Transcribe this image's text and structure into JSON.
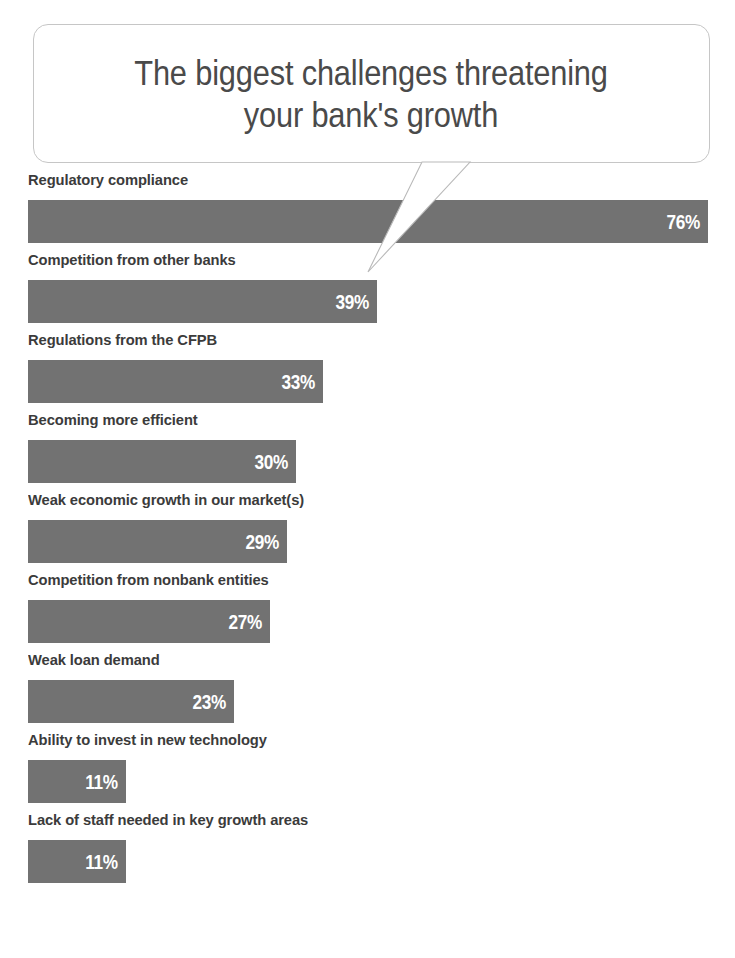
{
  "title": {
    "line1": "The biggest challenges threatening",
    "line2": "your bank's growth",
    "full": "The biggest challenges threatening\nyour bank's growth"
  },
  "colors": {
    "bar": "#727272",
    "bar_value_text": "#ffffff",
    "label_text": "#3b3b3b",
    "title_text": "#4a4a4a",
    "bubble_border": "#c6c6c6",
    "background": "#ffffff"
  },
  "chart_data": {
    "type": "bar",
    "orientation": "horizontal",
    "title": "The biggest challenges threatening your bank's growth",
    "subtitle": "",
    "xlabel": "",
    "ylabel": "",
    "grid": false,
    "legend": false,
    "axis_visible": false,
    "value_suffix": "%",
    "xlim": [
      0,
      76
    ],
    "categories": [
      "Regulatory compliance",
      "Competition from other banks",
      "Regulations from the CFPB",
      "Becoming more efficient",
      "Weak economic growth in our market(s)",
      "Competition from nonbank entities",
      "Weak loan demand",
      "Ability to invest in new technology",
      "Lack of staff needed in key growth areas"
    ],
    "values": [
      76,
      39,
      33,
      30,
      29,
      27,
      23,
      11,
      11
    ],
    "labels": [
      "76%",
      "39%",
      "33%",
      "30%",
      "29%",
      "27%",
      "23%",
      "11%",
      "11%"
    ],
    "bars": [
      {
        "label": "Regulatory compliance",
        "value": 76,
        "value_label": "76%"
      },
      {
        "label": "Competition from other banks",
        "value": 39,
        "value_label": "39%"
      },
      {
        "label": "Regulations from the CFPB",
        "value": 33,
        "value_label": "33%"
      },
      {
        "label": "Becoming more efficient",
        "value": 30,
        "value_label": "30%"
      },
      {
        "label": "Weak economic growth in our market(s)",
        "value": 29,
        "value_label": "29%"
      },
      {
        "label": "Competition from nonbank entities",
        "value": 27,
        "value_label": "27%"
      },
      {
        "label": "Weak loan demand",
        "value": 23,
        "value_label": "23%"
      },
      {
        "label": "Ability to invest in new technology",
        "value": 11,
        "value_label": "11%"
      },
      {
        "label": "Lack of staff needed in key growth areas",
        "value": 11,
        "value_label": "11%"
      }
    ]
  }
}
